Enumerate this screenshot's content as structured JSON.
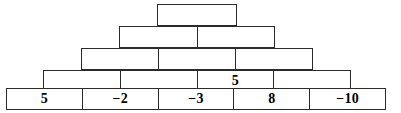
{
  "diagram": {
    "name": "number-pyramid",
    "orientation": "pyramid-ascending",
    "stroke_color": "#2b2b2b",
    "fill_color": "#ffffff",
    "text_color": "#000000",
    "rows": [
      {
        "index": 1,
        "label": "row-1-top",
        "cells": [
          {
            "value": ""
          }
        ]
      },
      {
        "index": 2,
        "label": "row-2",
        "cells": [
          {
            "value": ""
          },
          {
            "value": ""
          }
        ]
      },
      {
        "index": 3,
        "label": "row-3",
        "cells": [
          {
            "value": ""
          },
          {
            "value": ""
          },
          {
            "value": ""
          }
        ]
      },
      {
        "index": 4,
        "label": "row-4",
        "cells": [
          {
            "value": ""
          },
          {
            "value": ""
          },
          {
            "value": "5"
          },
          {
            "value": ""
          }
        ]
      },
      {
        "index": 5,
        "label": "row-5-base",
        "cells": [
          {
            "value": "5"
          },
          {
            "value": "−2"
          },
          {
            "value": "−3"
          },
          {
            "value": "8"
          },
          {
            "value": "−10"
          }
        ]
      }
    ]
  }
}
